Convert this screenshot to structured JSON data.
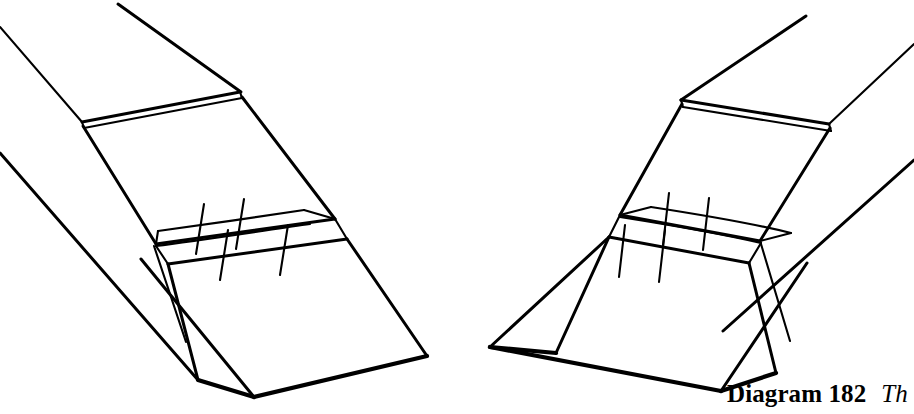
{
  "page": {
    "width": 914,
    "height": 414,
    "background_color": "#ffffff",
    "ink_color": "#000000",
    "kind": "line-art instructional diagram"
  },
  "caption": {
    "label": "Diagram 182",
    "text": "Th",
    "note_clipped": "italic caption text is cut off at the right edge of the image"
  },
  "figures": [
    {
      "name": "left-figure",
      "title": "folded paper form, left view",
      "parts": [
        "upper-flap-panel",
        "pleated-band",
        "lower-flap-panel",
        "base-plane",
        "strip-edges-to-upper-left"
      ]
    },
    {
      "name": "right-figure",
      "title": "folded paper form, right view",
      "parts": [
        "upper-flap-panel",
        "pleated-band",
        "lower-flap-panel",
        "base-plane",
        "strip-edges-to-upper-right"
      ]
    }
  ],
  "geometry": {
    "left": {
      "strip_top_edge": "M 118 4 L 239 91",
      "strip_top_edge_2": "M 0 27 L 82 122",
      "strip_lower_edge": "M 0 153 L 196 378",
      "seam_top_a": "M 82 122 L 239 91",
      "seam_top_b": "M 83 126 L 240 96",
      "panel_left_edge": "M 82 124 L 155 243",
      "panel_right_edge": "M 240 94 L 334 218",
      "band_upper_front": "M 155 243 L 334 218",
      "band_upper_back": "M 157 230 L 303 208",
      "band_lower_front": "M 167 263 L 345 238",
      "band_lower_back": "M 155 245 L 334 220",
      "band_right_cap": "M 334 218 L 345 238",
      "pleat_ticks": [
        "M 203 205 L 195 253",
        "M 243 200 L 235 248",
        "M 286 226 L 278 274",
        "M 226 231 L 218 279"
      ],
      "lower_flap_left": "M 167 263 L 196 378",
      "lower_flap_right": "M 345 238 L 426 355",
      "lower_flap_bottom": "M 196 378 L 253 396",
      "inner_fold": "M 153 245 L 185 340",
      "base_left_edge": "M 140 258 L 253 396",
      "base_bottom_edge": "M 253 396 L 426 355"
    },
    "right": {
      "strip_top_edge": "M 806 16 L 682 100",
      "strip_top_edge_2": "M 914 44 L 828 123",
      "strip_lower_edge": "M 914 160 L 724 330",
      "seam_top_a": "M 682 100 L 828 124",
      "seam_top_b": "M 683 105 L 829 129",
      "panel_left_edge": "M 682 102 L 619 214",
      "panel_right_edge": "M 828 127 L 759 240",
      "band_upper_front": "M 619 214 L 759 240",
      "band_upper_back": "M 650 206 L 790 232",
      "band_lower_front": "M 608 236 L 748 262",
      "band_lower_back": "M 619 216 L 759 242",
      "band_left_cap": "M 619 214 L 608 236",
      "pleat_ticks": [
        "M 668 194 L 662 244",
        "M 708 199 L 702 249",
        "M 624 226 L 618 276",
        "M 664 231 L 658 281"
      ],
      "lower_flap_left": "M 608 236 L 555 352",
      "lower_flap_right": "M 748 262 L 775 372",
      "lower_flap_bottom": "M 775 372 L 720 390",
      "inner_fold": "M 760 243 L 789 340",
      "base_right_edge": "M 806 262 L 720 390",
      "base_bottom_edge": "M 720 390 L 489 346"
    }
  }
}
